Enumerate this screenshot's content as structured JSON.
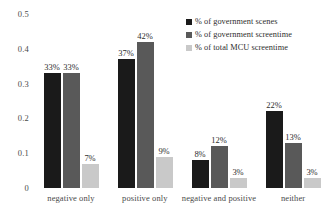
{
  "chart_data": {
    "type": "bar",
    "title": "",
    "xlabel": "",
    "ylabel": "",
    "ylim": [
      0,
      0.5
    ],
    "grid": false,
    "legend_position": "top-right",
    "y_ticks": [
      "0",
      "0.1",
      "0.2",
      "0.3",
      "0.4",
      "0.5"
    ],
    "y_tick_values": [
      0,
      0.1,
      0.2,
      0.3,
      0.4,
      0.5
    ],
    "categories": [
      "negative only",
      "positive only",
      "negative and positive",
      "neither"
    ],
    "series": [
      {
        "name": "% of government scenes",
        "color": "#1a1a1a",
        "values": [
          0.33,
          0.37,
          0.08,
          0.22
        ],
        "labels": [
          "33%",
          "37%",
          "8%",
          "22%"
        ]
      },
      {
        "name": "% of government screentime",
        "color": "#595959",
        "values": [
          0.33,
          0.42,
          0.12,
          0.13
        ],
        "labels": [
          "33%",
          "42%",
          "12%",
          "13%"
        ]
      },
      {
        "name": "% of total MCU screentime",
        "color": "#c9c9c9",
        "values": [
          0.07,
          0.09,
          0.03,
          0.03
        ],
        "labels": [
          "7%",
          "9%",
          "3%",
          "3%"
        ]
      }
    ]
  }
}
